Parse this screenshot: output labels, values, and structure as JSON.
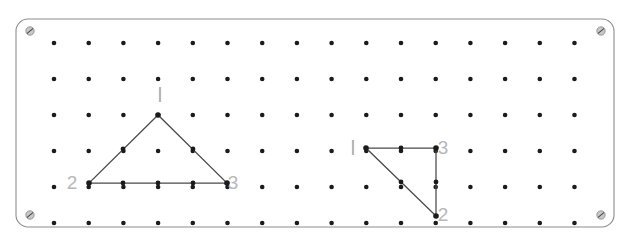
{
  "figure": {
    "kind": "geoboard-diagram",
    "title": "",
    "board": {
      "x": 16,
      "y": 19,
      "width": 598,
      "height": 208,
      "corner_radius": 12,
      "border_color": "#8d8d8d",
      "fill_color": "#ffffff"
    },
    "peg_grid": {
      "columns": 16,
      "rows": 6,
      "origin_x": 54,
      "origin_y": 43,
      "spacing_x": 34.7,
      "spacing_y": 36.0,
      "peg_radius": 2.3,
      "peg_color": "#1b1b1b"
    },
    "corner_screws": [
      {
        "name": "screw-top-left",
        "x": 30,
        "y": 31
      },
      {
        "name": "screw-top-right",
        "x": 601,
        "y": 31
      },
      {
        "name": "screw-bottom-left",
        "x": 30,
        "y": 215
      },
      {
        "name": "screw-bottom-right",
        "x": 601,
        "y": 215
      }
    ],
    "shapes": [
      {
        "name": "isosceles-triangle",
        "label": "left-triangle",
        "band_color": "#4a4a4a",
        "vertices": [
          {
            "label": "1",
            "col": 4,
            "row": 3,
            "x": 158,
            "y": 115,
            "label_x": 160,
            "label_y": 101,
            "label_style": "tick"
          },
          {
            "label": "2",
            "col": 2,
            "row": 5,
            "x": 89,
            "y": 183,
            "label_x": 72,
            "label_y": 189,
            "label_style": "numeral"
          },
          {
            "label": "3",
            "col": 6,
            "row": 5,
            "x": 227,
            "y": 183,
            "label_x": 233,
            "label_y": 189,
            "label_style": "numeral"
          }
        ],
        "pegs_on_band": [
          {
            "x": 123,
            "y": 149
          },
          {
            "x": 193,
            "y": 149
          },
          {
            "x": 123,
            "y": 183
          },
          {
            "x": 158,
            "y": 183
          },
          {
            "x": 193,
            "y": 183
          }
        ]
      },
      {
        "name": "right-triangle",
        "label": "right-triangle",
        "band_color": "#4a4a4a",
        "vertices": [
          {
            "label": "1",
            "col": 10,
            "row": 4,
            "x": 366,
            "y": 148,
            "label_x": 353,
            "label_y": 154,
            "label_style": "tick"
          },
          {
            "label": "3",
            "col": 12,
            "row": 4,
            "x": 436,
            "y": 148,
            "label_x": 443,
            "label_y": 154,
            "label_style": "numeral"
          },
          {
            "label": "2",
            "col": 12,
            "row": 6,
            "x": 436,
            "y": 216,
            "label_x": 443,
            "label_y": 221,
            "label_style": "numeral"
          }
        ],
        "pegs_on_band": [
          {
            "x": 401,
            "y": 148
          },
          {
            "x": 436,
            "y": 182
          },
          {
            "x": 401,
            "y": 182
          }
        ]
      }
    ],
    "labels": {
      "vertex_one_left": "1",
      "vertex_two_left": "2",
      "vertex_three_left": "3",
      "vertex_one_right": "1",
      "vertex_two_right": "2",
      "vertex_three_right": "3",
      "label_color": "#b7b7b7"
    }
  }
}
